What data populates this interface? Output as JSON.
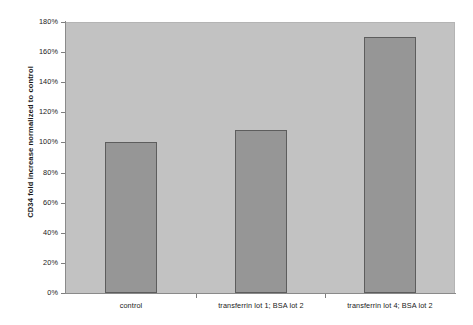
{
  "chart_data": {
    "type": "bar",
    "title": "",
    "xlabel": "",
    "ylabel": "CD34 fold increase normalized to control",
    "categories": [
      "control",
      "transferrin lot 1; BSA lot 2",
      "transferrin lot 4; BSA lot 2"
    ],
    "values": [
      100,
      108,
      170
    ],
    "value_labels": [
      "100%",
      "108%",
      "170%"
    ],
    "ylim": [
      0,
      180
    ],
    "ytick_values": [
      0,
      20,
      40,
      60,
      80,
      100,
      120,
      140,
      160,
      180
    ],
    "ytick_labels": [
      "0%",
      "20%",
      "40%",
      "60%",
      "80%",
      "100%",
      "120%",
      "140%",
      "160%",
      "180%"
    ],
    "grid": false,
    "legend": null,
    "legend_position": "none",
    "series": [
      {
        "name": "CD34 fold increase",
        "values": [
          100,
          108,
          170
        ]
      }
    ],
    "colors": {
      "bar_fill": "#969696",
      "bar_border": "#5d5d5d",
      "plot_background": "#c2c2c2",
      "figure_background": "#ffffff",
      "axis": "#8a8a8a",
      "text": "#1a1a1a"
    }
  }
}
